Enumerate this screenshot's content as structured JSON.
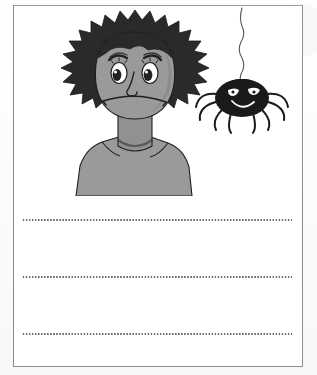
{
  "page": {
    "kind": "worksheet-scan",
    "background_color": "#fdfdfd",
    "frame_border_color": "#8e8e8e",
    "paper_color": "#ffffff"
  },
  "illustration": {
    "caption": "A worried boy looking at a spider hanging from a thread",
    "character": {
      "name": "worried-boy",
      "hair_color": "#2a2a2a",
      "skin_color": "#9a9a9a",
      "skin_shadow_color": "#848484",
      "outline_color": "#1f1f1f",
      "expression": "worried",
      "eye_white_color": "#ffffff",
      "pupil_color": "#222222"
    },
    "spider": {
      "name": "hanging-spider",
      "body_color": "#1a1a1a",
      "eye_color": "#ffffff",
      "thread_color": "#555555",
      "leg_count": 8,
      "expression": "smiling"
    }
  },
  "writing_lines": {
    "count": 3,
    "style": "dotted",
    "dot_color": "#4a4a4a",
    "values": [
      "",
      "",
      ""
    ]
  }
}
